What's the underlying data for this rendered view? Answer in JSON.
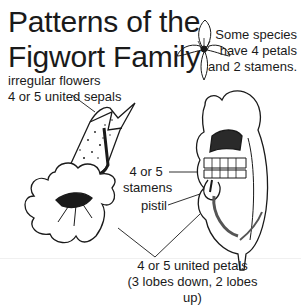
{
  "title": {
    "line1": "Patterns of the",
    "line2": "Figwort Family"
  },
  "note": {
    "line1": "Some species",
    "line2": "have 4 petals",
    "line3": "and 2 stamens."
  },
  "labels": {
    "sepals_line1": "irregular flowers",
    "sepals_line2": "4 or 5 united sepals",
    "stamens_line1": "4 or 5",
    "stamens_line2": "stamens",
    "pistil": "pistil",
    "petals_line1": "4 or 5 united petals",
    "petals_line2": "(3 lobes down, 2 lobes up)"
  },
  "illustrations": {
    "small_flower": "four-petaled-flower-icon",
    "front_flower": "figwort-flower-front-view",
    "side_flower": "snapdragon-flower-side-view"
  },
  "colors": {
    "ink": "#1a1a1a",
    "background": "#ffffff"
  }
}
